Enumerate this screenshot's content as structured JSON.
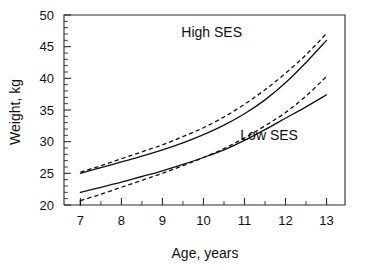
{
  "chart_data": {
    "type": "line",
    "title": "",
    "xlabel": "Age, years",
    "ylabel": "Weight, kg",
    "xlim": [
      6.6,
      13.45
    ],
    "ylim": [
      20,
      50
    ],
    "xticks": [
      7,
      8,
      9,
      10,
      11,
      12,
      13
    ],
    "yticks": [
      20,
      25,
      30,
      35,
      40,
      45,
      50
    ],
    "xtick_labels": [
      "7",
      "8",
      "9",
      "10",
      "11",
      "12",
      "13"
    ],
    "ytick_labels": [
      "20",
      "25",
      "30",
      "35",
      "40",
      "45",
      "50"
    ],
    "minor_ticks": true,
    "grid": false,
    "legend_position": "inline-annotations",
    "annotations": [
      {
        "text": "High SES",
        "x": 10.2,
        "y": 46.6
      },
      {
        "text": "Low SES",
        "x": 11.6,
        "y": 30.2
      }
    ],
    "x": [
      7,
      7.5,
      8,
      8.5,
      9,
      9.5,
      10,
      10.5,
      11,
      11.5,
      12,
      12.5,
      13
    ],
    "series": [
      {
        "name": "High SES solid",
        "group": "High SES",
        "style": "solid",
        "values": [
          25.0,
          25.9,
          26.8,
          27.7,
          28.7,
          29.8,
          31.1,
          32.6,
          34.4,
          36.6,
          39.3,
          42.5,
          46.0
        ]
      },
      {
        "name": "High SES dashed",
        "group": "High SES",
        "style": "dashed",
        "values": [
          25.2,
          26.2,
          27.3,
          28.4,
          29.5,
          30.8,
          32.2,
          33.9,
          35.9,
          38.2,
          40.8,
          43.7,
          47.1
        ]
      },
      {
        "name": "Low SES solid",
        "group": "Low SES",
        "style": "solid",
        "values": [
          22.0,
          22.8,
          23.6,
          24.5,
          25.4,
          26.4,
          27.5,
          28.7,
          30.2,
          31.9,
          33.7,
          35.5,
          37.4
        ]
      },
      {
        "name": "Low SES dashed",
        "group": "Low SES",
        "style": "dashed",
        "values": [
          20.7,
          21.7,
          22.8,
          23.9,
          25.0,
          26.2,
          27.5,
          28.9,
          30.6,
          32.5,
          34.6,
          37.2,
          40.3
        ]
      }
    ]
  },
  "axes": {
    "x_title": "Age, years",
    "y_title": "Weight, kg"
  },
  "style": {
    "line_color": "#111111",
    "axis_color": "#2b2b2b",
    "background": "#ffffff"
  }
}
